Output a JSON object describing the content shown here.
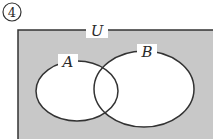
{
  "problem_number": "4",
  "diagram": {
    "type": "venn",
    "universe_label": "U",
    "sets": [
      {
        "name": "A"
      },
      {
        "name": "B"
      }
    ],
    "shaded_region": "complement of (A ∪ B)",
    "colors": {
      "shade": "#c8c8c8",
      "stroke": "#333333",
      "inside": "#ffffff"
    }
  }
}
